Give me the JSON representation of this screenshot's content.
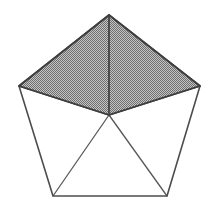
{
  "figure": {
    "shape_name": "pentagon",
    "background_color": "#ffffff",
    "outline_color": "#4d4d4d",
    "shaded_fill_color": "#9a9a9a",
    "shaded_fill_style": "halftone-dither",
    "unshaded_fill_color": "#ffffff",
    "outline_width_px": 1.6,
    "spoke_width_px": 1.3,
    "canvas": {
      "width": 212,
      "height": 208
    },
    "vertices": [
      {
        "name": "apex",
        "label": "A",
        "x": 109,
        "y": 15
      },
      {
        "name": "right",
        "label": "B",
        "x": 200,
        "y": 86
      },
      {
        "name": "bottom-right",
        "label": "C",
        "x": 167,
        "y": 196
      },
      {
        "name": "bottom-left",
        "label": "D",
        "x": 53,
        "y": 196
      },
      {
        "name": "left",
        "label": "E",
        "x": 19,
        "y": 86
      }
    ],
    "center": {
      "name": "center",
      "label": "O",
      "x": 109,
      "y": 115
    },
    "sectors": [
      {
        "name": "sector-apex-left",
        "points": "109,15 19,86 109,115",
        "shaded": true
      },
      {
        "name": "sector-apex-right",
        "points": "109,15 200,86 109,115",
        "shaded": true
      },
      {
        "name": "sector-right-bottomright",
        "points": "200,86 167,196 109,115",
        "shaded": false
      },
      {
        "name": "sector-bottom",
        "points": "167,196 53,196 109,115",
        "shaded": false
      },
      {
        "name": "sector-left-bottomleft",
        "points": "53,196 19,86 109,115",
        "shaded": false
      }
    ],
    "perimeter_path": "109,15 200,86 167,196 53,196 19,86",
    "spokes": [
      {
        "name": "spoke-to-apex",
        "x1": 109,
        "y1": 115,
        "x2": 109,
        "y2": 15
      },
      {
        "name": "spoke-to-right",
        "x1": 109,
        "y1": 115,
        "x2": 200,
        "y2": 86
      },
      {
        "name": "spoke-to-bottom-right",
        "x1": 109,
        "y1": 115,
        "x2": 167,
        "y2": 196
      },
      {
        "name": "spoke-to-bottom-left",
        "x1": 109,
        "y1": 115,
        "x2": 53,
        "y2": 196
      },
      {
        "name": "spoke-to-left",
        "x1": 109,
        "y1": 115,
        "x2": 19,
        "y2": 86
      }
    ],
    "shaded_sector_count": 2,
    "total_sector_count": 5
  }
}
